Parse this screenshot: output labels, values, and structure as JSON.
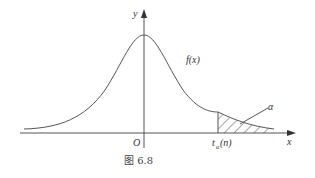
{
  "figure": {
    "caption": "图 6.8",
    "curve_label": "f(x)",
    "x_axis_label": "x",
    "y_axis_label": "y",
    "origin_label": "O",
    "quantile_label_main": "t",
    "quantile_label_sub": "α",
    "quantile_label_arg": "(n)",
    "area_label": "α"
  },
  "colors": {
    "line": "#555555",
    "background": "#ffffff"
  }
}
